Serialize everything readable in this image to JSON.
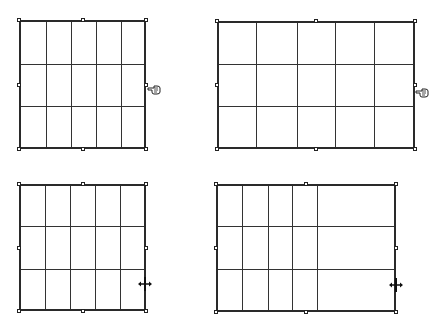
{
  "panels": [
    {
      "id": "top-left",
      "box": {
        "left": 19,
        "top": 20,
        "right": 146,
        "bottom": 149
      },
      "columns_x": [
        46,
        71,
        96,
        121
      ],
      "rows_y": [
        64,
        106
      ],
      "cursor": {
        "icon": "hand-pointer-icon",
        "x": 147,
        "y": 81
      }
    },
    {
      "id": "top-right",
      "box": {
        "left": 217,
        "top": 21,
        "right": 415,
        "bottom": 149
      },
      "columns_x": [
        256,
        297,
        335,
        374
      ],
      "rows_y": [
        64,
        106
      ],
      "cursor": {
        "icon": "hand-pointer-icon",
        "x": 415,
        "y": 84
      }
    },
    {
      "id": "bottom-left",
      "box": {
        "left": 19,
        "top": 184,
        "right": 146,
        "bottom": 311
      },
      "columns_x": [
        45,
        70,
        95,
        120
      ],
      "rows_y": [
        226,
        269
      ],
      "cursor": {
        "icon": "move-resize-icon",
        "x": 138,
        "y": 277
      }
    },
    {
      "id": "bottom-right",
      "box": {
        "left": 216,
        "top": 184,
        "right": 396,
        "bottom": 312
      },
      "columns_x": [
        242,
        268,
        292,
        317
      ],
      "rows_y": [
        226,
        269
      ],
      "cursor": {
        "icon": "move-resize-icon",
        "x": 389,
        "y": 278
      }
    }
  ],
  "colors": {
    "line": "#333333",
    "border": "#2a2a2a",
    "background": "#ffffff"
  }
}
